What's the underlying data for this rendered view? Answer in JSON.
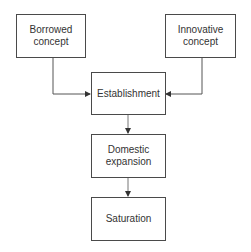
{
  "diagram": {
    "type": "flowchart",
    "nodes": [
      {
        "id": "borrowed",
        "label": "Borrowed concept"
      },
      {
        "id": "innovative",
        "label": "Innovative concept"
      },
      {
        "id": "establishment",
        "label": "Establishment"
      },
      {
        "id": "domestic",
        "label": "Domestic expansion"
      },
      {
        "id": "saturation",
        "label": "Saturation"
      }
    ],
    "edges": [
      {
        "from": "borrowed",
        "to": "establishment"
      },
      {
        "from": "innovative",
        "to": "establishment"
      },
      {
        "from": "establishment",
        "to": "domestic"
      },
      {
        "from": "domestic",
        "to": "saturation"
      }
    ],
    "colors": {
      "stroke": "#4a4a4a",
      "text": "#333333",
      "background": "#ffffff"
    }
  },
  "labels": {
    "borrowed_1": "Borrowed",
    "borrowed_2": "concept",
    "innovative_1": "Innovative",
    "innovative_2": "concept",
    "establishment": "Establishment",
    "domestic_1": "Domestic",
    "domestic_2": "expansion",
    "saturation": "Saturation"
  }
}
